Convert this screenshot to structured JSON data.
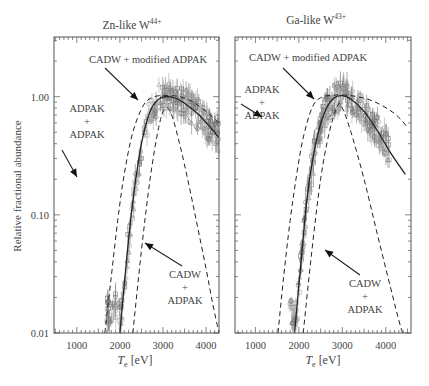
{
  "figure": {
    "ylabel": "Relative fractional abundance",
    "xlabel_main": "T",
    "xlabel_sub": "e",
    "xlabel_unit": " [eV]"
  },
  "chart_data": [
    {
      "type": "line",
      "title": "Zn-like W",
      "title_sup": "44+",
      "xlabel": "T_e [eV]",
      "ylabel": "Relative fractional abundance",
      "xscale": "linear",
      "yscale": "log",
      "xlim": [
        470,
        4300
      ],
      "ylim": [
        0.01,
        3.2
      ],
      "xticks": [
        1000,
        2000,
        3000,
        4000
      ],
      "xtick_labels": [
        "1000",
        "2000",
        "3000",
        "4000"
      ],
      "yticks": [
        0.01,
        0.1,
        1.0
      ],
      "ytick_labels": [
        "0.01",
        "0.10",
        "1.00"
      ],
      "grid": false,
      "series": [
        {
          "name": "CADW + modified ADPAK",
          "style": "solid",
          "x": [
            2000,
            2150,
            2300,
            2500,
            2700,
            2900,
            3100,
            3300,
            3500,
            3800,
            4100,
            4300
          ],
          "y": [
            0.01,
            0.04,
            0.13,
            0.4,
            0.75,
            0.95,
            1.0,
            0.97,
            0.88,
            0.72,
            0.55,
            0.45
          ]
        },
        {
          "name": "ADPAK + ADPAK",
          "style": "dashed",
          "x": [
            1650,
            1800,
            1950,
            2100,
            2300,
            2550,
            2800,
            3100,
            3400,
            3700,
            4000,
            4300
          ],
          "y": [
            0.01,
            0.03,
            0.09,
            0.22,
            0.5,
            0.85,
            1.0,
            1.02,
            1.0,
            0.9,
            0.75,
            0.6
          ]
        },
        {
          "name": "CADW + ADPAK",
          "style": "dashed",
          "x": [
            2300,
            2500,
            2700,
            2900,
            3050,
            3200,
            3400,
            3600,
            3800,
            4000,
            4150,
            4300
          ],
          "y": [
            0.01,
            0.05,
            0.2,
            0.55,
            0.8,
            0.7,
            0.38,
            0.18,
            0.08,
            0.035,
            0.018,
            0.01
          ]
        }
      ],
      "measured": {
        "x_range": [
          1700,
          4300
        ],
        "peak_x": 3100,
        "peak_y": 1.0,
        "markers": [
          "square",
          "circle",
          "triangle"
        ]
      },
      "annotations": [
        {
          "text": "CADW + modified ADPAK",
          "x_px": 148,
          "y_px": 63
        },
        {
          "text": "ADPAK",
          "x_px": 87,
          "y_px": 112
        },
        {
          "text": "+",
          "x_px": 87,
          "y_px": 125
        },
        {
          "text": "ADPAK",
          "x_px": 87,
          "y_px": 138
        },
        {
          "text": "CADW",
          "x_px": 185,
          "y_px": 278
        },
        {
          "text": "+",
          "x_px": 185,
          "y_px": 291
        },
        {
          "text": "ADPAK",
          "x_px": 185,
          "y_px": 304
        }
      ]
    },
    {
      "type": "line",
      "title": "Ga-like W",
      "title_sup": "43+",
      "xlabel": "T_e [eV]",
      "ylabel": "",
      "xscale": "linear",
      "yscale": "log",
      "xlim": [
        530,
        4580
      ],
      "ylim": [
        0.01,
        3.2
      ],
      "xticks": [
        1000,
        2000,
        3000,
        4000
      ],
      "xtick_labels": [
        "1000",
        "2000",
        "3000",
        "4000"
      ],
      "yticks": [
        0.01,
        0.1,
        1.0
      ],
      "ytick_labels": [
        "",
        "",
        ""
      ],
      "grid": false,
      "series": [
        {
          "name": "CADW + modified ADPAK",
          "style": "solid",
          "x": [
            1900,
            2050,
            2200,
            2400,
            2600,
            2800,
            3000,
            3200,
            3500,
            3800,
            4100,
            4450
          ],
          "y": [
            0.01,
            0.04,
            0.15,
            0.42,
            0.75,
            0.97,
            1.02,
            0.95,
            0.75,
            0.52,
            0.34,
            0.22
          ]
        },
        {
          "name": "ADPAK + ADPAK",
          "style": "dashed",
          "x": [
            1520,
            1650,
            1800,
            1950,
            2100,
            2300,
            2500,
            2800,
            3200,
            3700,
            4200,
            4500
          ],
          "y": [
            0.01,
            0.03,
            0.09,
            0.22,
            0.45,
            0.8,
            0.98,
            1.03,
            1.02,
            0.92,
            0.72,
            0.55
          ]
        },
        {
          "name": "CADW + ADPAK",
          "style": "dashed",
          "x": [
            2100,
            2300,
            2500,
            2700,
            2900,
            3000,
            3200,
            3500,
            3800,
            4100,
            4350,
            4500
          ],
          "y": [
            0.01,
            0.05,
            0.2,
            0.5,
            0.85,
            0.8,
            0.5,
            0.2,
            0.07,
            0.025,
            0.011,
            0.008
          ]
        }
      ],
      "measured": {
        "x_range": [
          1750,
          4100
        ],
        "peak_x": 3000,
        "peak_y": 1.0,
        "markers": [
          "square",
          "circle",
          "triangle"
        ]
      },
      "annotations": [
        {
          "text": "CADW + modified ADPAK",
          "x_px": 308,
          "y_px": 61
        },
        {
          "text": "ADPAK",
          "x_px": 262,
          "y_px": 93
        },
        {
          "text": "+",
          "x_px": 262,
          "y_px": 106
        },
        {
          "text": "ADPAK",
          "x_px": 262,
          "y_px": 119
        },
        {
          "text": "CADW",
          "x_px": 365,
          "y_px": 287
        },
        {
          "text": "+",
          "x_px": 365,
          "y_px": 300
        },
        {
          "text": "ADPAK",
          "x_px": 365,
          "y_px": 313
        }
      ]
    }
  ],
  "layout": {
    "panels": [
      {
        "left": 54,
        "top": 37,
        "right": 219,
        "bottom": 333,
        "title_x": 132,
        "title_y": 29
      },
      {
        "left": 235,
        "top": 37,
        "right": 411,
        "bottom": 333,
        "title_x": 316,
        "title_y": 24
      }
    ],
    "arrows": [
      [
        [
          105,
          68
        ],
        [
          138,
          100
        ]
      ],
      [
        [
          62,
          150
        ],
        [
          77,
          177
        ]
      ],
      [
        [
          182,
          266
        ],
        [
          145,
          243
        ]
      ],
      [
        [
          283,
          68
        ],
        [
          314,
          99
        ]
      ],
      [
        [
          241,
          104
        ],
        [
          262,
          117
        ]
      ],
      [
        [
          360,
          275
        ],
        [
          325,
          250
        ]
      ]
    ],
    "colors": {
      "axis": "#555555",
      "curve": "#222222",
      "data": "#777777",
      "data_light": "#aaaaaa"
    }
  }
}
